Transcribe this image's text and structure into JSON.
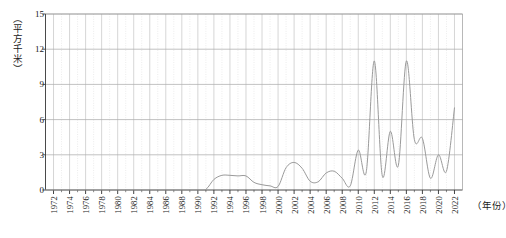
{
  "chart_data": {
    "type": "line",
    "title": "",
    "subtitle": "",
    "xlabel": "（年份）",
    "ylabel": "（平方千米）",
    "xlim": [
      1971,
      2023
    ],
    "ylim": [
      0,
      15
    ],
    "yticks": [
      0,
      3,
      6,
      9,
      12,
      15
    ],
    "ytick_labels": [
      "0",
      "3",
      "6",
      "9",
      "12",
      "15"
    ],
    "xticks": [
      1972,
      1974,
      1976,
      1978,
      1980,
      1982,
      1984,
      1986,
      1988,
      1990,
      1992,
      1994,
      1996,
      1998,
      2000,
      2002,
      2004,
      2006,
      2008,
      2010,
      2012,
      2014,
      2016,
      2018,
      2020,
      2022
    ],
    "xtick_labels": [
      "1972",
      "1974",
      "1976",
      "1978",
      "1980",
      "1982",
      "1984",
      "1986",
      "1988",
      "1990",
      "1992",
      "1994",
      "1996",
      "1998",
      "2000",
      "2002",
      "2004",
      "2006",
      "2008",
      "2010",
      "2012",
      "2014",
      "2016",
      "2018",
      "2020",
      "2022"
    ],
    "grid": {
      "horizontal": true,
      "vertical": true,
      "vertical_style": "dotted-yearly",
      "horizontal_color": "#b9b9b9",
      "vertical_color": "#d8d8d8"
    },
    "legend": null,
    "line_color": "#9a9a9a",
    "line_width": 1.0,
    "x": [
      1971,
      1972,
      1973,
      1974,
      1975,
      1976,
      1977,
      1978,
      1979,
      1980,
      1981,
      1982,
      1983,
      1984,
      1985,
      1986,
      1987,
      1988,
      1989,
      1990,
      1991,
      1992,
      1993,
      1994,
      1995,
      1996,
      1997,
      1998,
      1999,
      2000,
      2001,
      2002,
      2003,
      2004,
      2005,
      2006,
      2007,
      2008,
      2009,
      2010,
      2011,
      2012,
      2013,
      2014,
      2015,
      2016,
      2017,
      2018,
      2019,
      2020,
      2021,
      2022
    ],
    "values": [
      0.0,
      0.0,
      0.0,
      0.0,
      0.0,
      0.0,
      0.0,
      0.0,
      0.0,
      0.0,
      0.0,
      0.0,
      0.0,
      0.0,
      0.0,
      0.0,
      0.0,
      0.0,
      0.0,
      0.0,
      0.05,
      0.9,
      1.25,
      1.25,
      1.2,
      1.2,
      0.65,
      0.45,
      0.35,
      0.3,
      1.9,
      2.35,
      1.85,
      0.75,
      0.7,
      1.45,
      1.6,
      1.0,
      0.35,
      3.4,
      1.55,
      11.0,
      1.2,
      5.0,
      2.1,
      11.0,
      4.3,
      4.4,
      1.0,
      3.0,
      1.6,
      7.0
    ],
    "series_name": "面积"
  },
  "axis": {
    "y_title": "（平方千米）",
    "x_title": "（年份）"
  },
  "caption": {
    "partial_text": ""
  }
}
